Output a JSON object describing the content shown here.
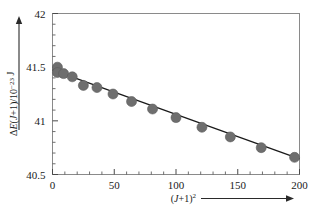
{
  "chart_data": {
    "type": "scatter",
    "title": "",
    "subtitle": "",
    "xlabel": "(J+1)²",
    "ylabel": "ΔE(J+1)/10⁻²³ J",
    "xlim": [
      0,
      200
    ],
    "ylim": [
      40.5,
      42
    ],
    "grid": false,
    "legend": false,
    "legend_position": "none",
    "xticks": [
      0,
      50,
      100,
      150,
      200
    ],
    "xtick_labels": [
      "0",
      "50",
      "100",
      "150",
      "200"
    ],
    "xminor_step": 10,
    "yticks": [
      40.5,
      41,
      41.5,
      42
    ],
    "ytick_labels": [
      "40.5",
      "41",
      "41.5",
      "42"
    ],
    "yminor_step": 0.1,
    "marker_color": "#6e6e6e",
    "line_color": "#1a1a1a",
    "frame_color": "#8a8a8a",
    "marker_size": 5,
    "series": [
      {
        "name": "data",
        "x": [
          4,
          4,
          9,
          16,
          25,
          36,
          49,
          64,
          81,
          100,
          121,
          144,
          169,
          196
        ],
        "y": [
          41.5,
          41.45,
          41.44,
          41.41,
          41.33,
          41.31,
          41.25,
          41.18,
          41.11,
          41.03,
          40.94,
          40.85,
          40.75,
          40.66
        ]
      }
    ],
    "fit_line": {
      "name": "linear-fit",
      "x": [
        0,
        200
      ],
      "y": [
        41.475,
        40.645
      ],
      "intercept": 41.475,
      "slope": -0.00415
    },
    "axis_arrows": {
      "x_arrow": true,
      "y_arrow": true
    }
  },
  "figure": {
    "name": "rotational-energy-difference-plot"
  }
}
